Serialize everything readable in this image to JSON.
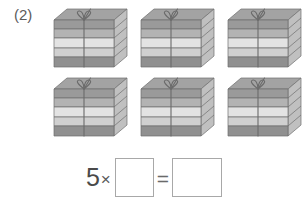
{
  "worksheet": {
    "problem_number": "(2)",
    "illustration": {
      "icon_name": "gift-box-stack-icon",
      "count": 6,
      "rows": 2,
      "columns": 3,
      "layers_per_box": 5,
      "description": "gift box tied with ribbon and bow, made of five stacked slabs",
      "colors": {
        "top_face": "#9a9a9a",
        "layer_dark": "#8e8e8e",
        "layer_mid": "#b5b5b5",
        "layer_light": "#e2e2e2",
        "layer_lighter": "#d2d2d2",
        "side_face": "#b9b9b9",
        "outline": "#6f6f6f",
        "ribbon": "#6b6b6b"
      },
      "boxes": [
        {
          "id": "gift-box-1",
          "row": 1,
          "col": 1
        },
        {
          "id": "gift-box-2",
          "row": 1,
          "col": 2
        },
        {
          "id": "gift-box-3",
          "row": 1,
          "col": 3
        },
        {
          "id": "gift-box-4",
          "row": 2,
          "col": 1
        },
        {
          "id": "gift-box-5",
          "row": 2,
          "col": 2
        },
        {
          "id": "gift-box-6",
          "row": 2,
          "col": 3
        }
      ]
    },
    "equation": {
      "multiplier": "5",
      "times_symbol": "×",
      "equals_symbol": "=",
      "blank_1_value": "",
      "blank_1_placeholder": "",
      "blank_2_value": "",
      "blank_2_placeholder": ""
    }
  }
}
